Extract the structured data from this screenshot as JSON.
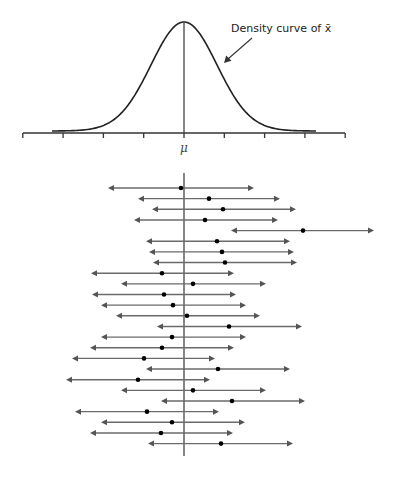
{
  "figure": {
    "annotation": "Density curve of x̄",
    "center_label": "μ"
  },
  "colors": {
    "curve": "#222222",
    "axis": "#333333",
    "interval_line": "#6b6b6b",
    "arrowhead": "#555555",
    "dot": "#000000",
    "mean_line": "#444444"
  },
  "chart_data": {
    "type": "diagram",
    "title": "",
    "density_curve": {
      "label": "Density curve of x̄",
      "center": "μ",
      "axis_ticks": 9,
      "tick_positions_sd": [
        -4,
        -3,
        -2,
        -1,
        0,
        1,
        2,
        3,
        4
      ]
    },
    "intervals": [
      {
        "lower": -1.88,
        "estimate": -0.07,
        "upper": 1.74
      },
      {
        "lower": -1.14,
        "estimate": 0.62,
        "upper": 2.39
      },
      {
        "lower": -0.79,
        "estimate": 0.97,
        "upper": 2.78
      },
      {
        "lower": -1.24,
        "estimate": 0.52,
        "upper": 2.34
      },
      {
        "lower": 1.17,
        "estimate": 2.96,
        "upper": 4.73
      },
      {
        "lower": -0.94,
        "estimate": 0.82,
        "upper": 2.64
      },
      {
        "lower": -0.87,
        "estimate": 0.94,
        "upper": 2.74
      },
      {
        "lower": -0.77,
        "estimate": 1.02,
        "upper": 2.81
      },
      {
        "lower": -2.31,
        "estimate": -0.54,
        "upper": 1.24
      },
      {
        "lower": -1.56,
        "estimate": 0.22,
        "upper": 2.04
      },
      {
        "lower": -2.28,
        "estimate": -0.49,
        "upper": 1.29
      },
      {
        "lower": -2.06,
        "estimate": -0.27,
        "upper": 1.54
      },
      {
        "lower": -1.68,
        "estimate": 0.07,
        "upper": 1.89
      },
      {
        "lower": -0.67,
        "estimate": 1.12,
        "upper": 2.93
      },
      {
        "lower": -2.06,
        "estimate": -0.3,
        "upper": 1.54
      },
      {
        "lower": -2.34,
        "estimate": -0.54,
        "upper": 1.24
      },
      {
        "lower": -2.78,
        "estimate": -0.99,
        "upper": 0.77
      },
      {
        "lower": -0.94,
        "estimate": 0.84,
        "upper": 2.64
      },
      {
        "lower": -2.93,
        "estimate": -1.14,
        "upper": 0.64
      },
      {
        "lower": -1.56,
        "estimate": 0.22,
        "upper": 2.04
      },
      {
        "lower": -0.57,
        "estimate": 1.19,
        "upper": 3.01
      },
      {
        "lower": -2.71,
        "estimate": -0.92,
        "upper": 0.87
      },
      {
        "lower": -2.06,
        "estimate": -0.3,
        "upper": 1.51
      },
      {
        "lower": -2.34,
        "estimate": -0.57,
        "upper": 1.22
      },
      {
        "lower": -0.89,
        "estimate": 0.92,
        "upper": 2.71
      }
    ],
    "intervals_missing_mu": 1,
    "interval_count": 25
  },
  "render": {
    "mu_x": 184,
    "px_per_sd": 40.3,
    "axis_y": 133,
    "axis_x0": 23,
    "axis_x1": 345,
    "peak_y": 22,
    "sd_curve": 33,
    "tail_left_x": 52,
    "tail_right_x": 316,
    "mean_line_top": 173,
    "mean_line_bottom": 456,
    "row_y0": 188,
    "row_dy": 10.65,
    "rows_px": [
      [
        108,
        181,
        254
      ],
      [
        138,
        209,
        280
      ],
      [
        152,
        223,
        296
      ],
      [
        134,
        205,
        278
      ],
      [
        231,
        303,
        374
      ],
      [
        146,
        217,
        290
      ],
      [
        149,
        222,
        294
      ],
      [
        153,
        225,
        297
      ],
      [
        91,
        162,
        234
      ],
      [
        121,
        193,
        266
      ],
      [
        92,
        164,
        236
      ],
      [
        101,
        173,
        246
      ],
      [
        116,
        187,
        260
      ],
      [
        157,
        229,
        302
      ],
      [
        101,
        172,
        246
      ],
      [
        90,
        162,
        234
      ],
      [
        72,
        144,
        215
      ],
      [
        146,
        218,
        290
      ],
      [
        66,
        138,
        210
      ],
      [
        121,
        193,
        266
      ],
      [
        161,
        232,
        305
      ],
      [
        75,
        147,
        219
      ],
      [
        101,
        172,
        245
      ],
      [
        90,
        161,
        233
      ],
      [
        148,
        221,
        293
      ]
    ]
  }
}
